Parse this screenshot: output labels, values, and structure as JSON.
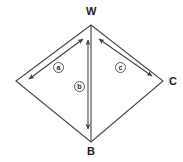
{
  "figure": {
    "type": "geometry-diagram",
    "shape": "kite-quadrilateral",
    "stroke_color": "#4a4a4a",
    "label_color": "#1d1d1d",
    "background_color": "#ffffff"
  },
  "vertices": [
    {
      "id": "W",
      "label": "W",
      "x": 91,
      "y": 25,
      "label_x": 86,
      "label_y": 6
    },
    {
      "id": "L",
      "label": "",
      "x": 16,
      "y": 81,
      "label_x": 0,
      "label_y": 0
    },
    {
      "id": "C",
      "label": "C",
      "x": 163,
      "y": 81,
      "label_x": 169,
      "label_y": 76
    },
    {
      "id": "B",
      "label": "B",
      "x": 91,
      "y": 142,
      "label_x": 87,
      "label_y": 146
    }
  ],
  "edges": [
    {
      "id": "W-L",
      "from": "W",
      "to": "L"
    },
    {
      "id": "L-B",
      "from": "L",
      "to": "B"
    },
    {
      "id": "B-C",
      "from": "B",
      "to": "C"
    },
    {
      "id": "C-W",
      "from": "C",
      "to": "W"
    },
    {
      "id": "W-B",
      "from": "W",
      "to": "B",
      "note": "vertical diagonal"
    }
  ],
  "measure_arrows": [
    {
      "id": "a",
      "label": "a",
      "style": "double-headed",
      "x1": 83,
      "y1": 39,
      "x2": 29,
      "y2": 79,
      "label_x": 53,
      "label_y": 62
    },
    {
      "id": "b",
      "label": "b",
      "style": "double-headed",
      "x1": 88,
      "y1": 40,
      "x2": 88,
      "y2": 129,
      "label_x": 74,
      "label_y": 81
    },
    {
      "id": "c",
      "label": "c",
      "style": "double-headed",
      "x1": 99,
      "y1": 39,
      "x2": 152,
      "y2": 76,
      "label_x": 115,
      "label_y": 62
    }
  ]
}
